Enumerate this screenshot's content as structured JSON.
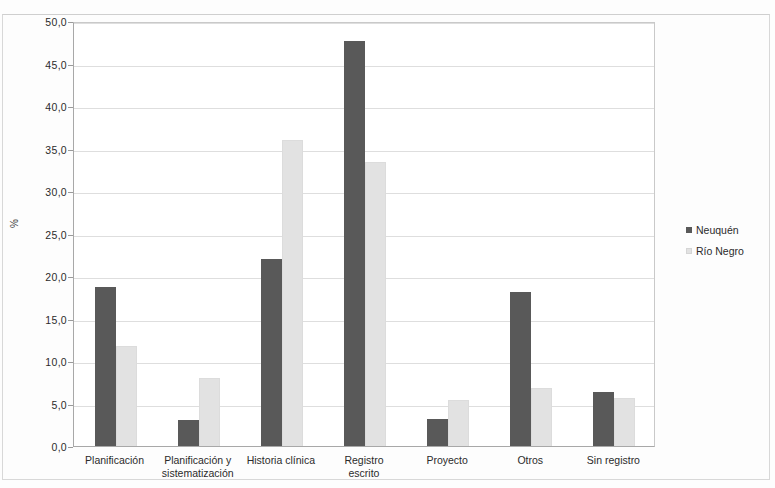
{
  "chart_data": {
    "type": "bar",
    "title": "",
    "xlabel": "",
    "ylabel": "%",
    "ylim": [
      0,
      50
    ],
    "ytick_step": 5,
    "ytick_labels": [
      "0,0",
      "5,0",
      "10,0",
      "15,0",
      "20,0",
      "25,0",
      "30,0",
      "35,0",
      "40,0",
      "45,0",
      "50,0"
    ],
    "ytick_values": [
      0,
      5,
      10,
      15,
      20,
      25,
      30,
      35,
      40,
      45,
      50
    ],
    "grid": true,
    "legend_position": "right",
    "categories": [
      "Planificación",
      "Planificación y\nsistematización",
      "Historia clínica",
      "Registro\nescrito",
      "Proyecto",
      "Otros",
      "Sin registro"
    ],
    "series": [
      {
        "name": "Neuquén",
        "color": "#595959",
        "values": [
          18.7,
          3.1,
          22.0,
          47.7,
          3.2,
          18.1,
          6.4
        ]
      },
      {
        "name": "Río Negro",
        "color": "#e2e2e2",
        "values": [
          11.8,
          8.0,
          36.0,
          33.4,
          5.4,
          6.8,
          5.7
        ]
      }
    ]
  }
}
